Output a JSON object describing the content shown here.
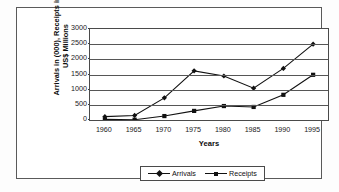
{
  "chart_data": {
    "type": "line",
    "title": "",
    "xlabel": "Years",
    "ylabel": "Arrivals in (000), Receipts in US$ Millions",
    "categories": [
      "1960",
      "1965",
      "1970",
      "1975",
      "1980",
      "1985",
      "1990",
      "1995"
    ],
    "x": [
      1960,
      1965,
      1970,
      1975,
      1980,
      1985,
      1990,
      1995
    ],
    "ylim": [
      0,
      3000
    ],
    "yticks": [
      0,
      500,
      1000,
      1500,
      2000,
      2500,
      3000
    ],
    "ytick_labels": [
      "0",
      "500",
      "1000",
      "1500",
      "2000",
      "2500",
      "3000"
    ],
    "grid": true,
    "legend_position": "bottom",
    "series": [
      {
        "name": "Arrivals",
        "marker": "diamond",
        "color": "#111111",
        "values": [
          110,
          150,
          730,
          1620,
          1450,
          1050,
          1700,
          2500
        ]
      },
      {
        "name": "Receipts",
        "marker": "square",
        "color": "#111111",
        "values": [
          20,
          10,
          130,
          300,
          460,
          430,
          830,
          1490
        ]
      }
    ]
  },
  "axis": {
    "y_title": "Arrivals in (000), Receipts in US$ Millions",
    "x_title": "Years"
  },
  "legend": {
    "items": [
      {
        "label": "Arrivals",
        "marker": "diamond-marker-icon"
      },
      {
        "label": "Receipts",
        "marker": "square-marker-icon"
      }
    ]
  }
}
